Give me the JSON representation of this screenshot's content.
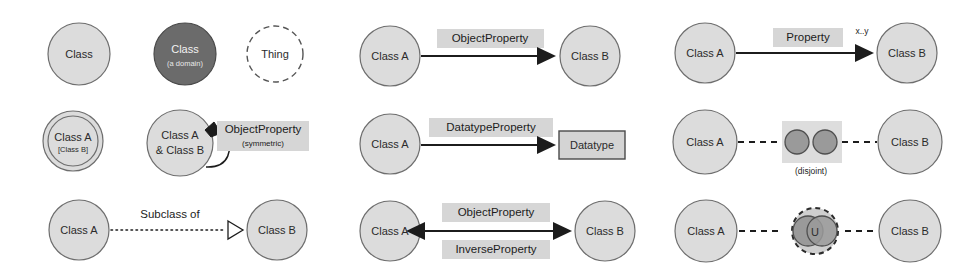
{
  "diagram": {
    "colors": {
      "class_fill": "#dcdcdc",
      "class_stroke": "#6e6e6e",
      "domain_fill": "#6b6b6b",
      "domain_stroke": "#4a4a4a",
      "thing_stroke": "#555555",
      "label_box_fill": "#d6d6d6",
      "datatype_fill": "#d4d4d4",
      "datatype_stroke": "#4a4a4a",
      "line": "#1c1c1c",
      "small_circle_fill": "#9a9a9a",
      "small_circle_stroke": "#4f4f4f",
      "text": "#1c1c1c",
      "text_on_dark": "#f2f2f2"
    },
    "columns": [
      {
        "name": "column-left",
        "rows": [
          {
            "name": "row-class-variants",
            "nodes": [
              {
                "name": "class-node",
                "label": "Class",
                "sub_label": "",
                "style": "filled-circle"
              },
              {
                "name": "class-domain-node",
                "label": "Class",
                "sub_label": "(a domain)",
                "style": "dark-circle"
              },
              {
                "name": "thing-node",
                "label": "Thing",
                "sub_label": "",
                "style": "dashed-circle"
              }
            ]
          },
          {
            "name": "row-equivalent-and-symmetric",
            "nodes": [
              {
                "name": "equivalent-class-node",
                "label": "Class A",
                "sub_label": "[Class B]",
                "style": "double-circle"
              },
              {
                "name": "merged-class-node",
                "label_line1": "Class A",
                "label_line2": "& Class B",
                "style": "filled-circle"
              }
            ],
            "edge": {
              "name": "symmetric-object-property-edge",
              "label": "ObjectProperty",
              "sub_label": "(symmetric)",
              "style": "self-loop-solid-arrow"
            }
          },
          {
            "name": "row-subclass",
            "source": {
              "name": "source-class-node",
              "label": "Class A"
            },
            "target": {
              "name": "target-class-node",
              "label": "Class B"
            },
            "edge": {
              "name": "subclass-of-edge",
              "label": "Subclass of",
              "style": "dotted-line-hollow-triangle"
            }
          }
        ]
      },
      {
        "name": "column-middle",
        "rows": [
          {
            "name": "row-object-property",
            "source": {
              "name": "source-class-node",
              "label": "Class A"
            },
            "target": {
              "name": "target-class-node",
              "label": "Class B"
            },
            "edge": {
              "name": "object-property-edge",
              "label": "ObjectProperty",
              "style": "solid-line-filled-arrow"
            }
          },
          {
            "name": "row-datatype-property",
            "source": {
              "name": "source-class-node",
              "label": "Class A"
            },
            "target": {
              "name": "datatype-node",
              "label": "Datatype",
              "style": "rectangle"
            },
            "edge": {
              "name": "datatype-property-edge",
              "label": "DatatypeProperty",
              "style": "solid-line-filled-arrow"
            }
          },
          {
            "name": "row-inverse-property",
            "source": {
              "name": "source-class-node",
              "label": "Class A"
            },
            "target": {
              "name": "target-class-node",
              "label": "Class B"
            },
            "edge": {
              "name": "inverse-property-edge",
              "label_above": "ObjectProperty",
              "label_below": "InverseProperty",
              "style": "double-headed-solid-arrow"
            }
          }
        ]
      },
      {
        "name": "column-right",
        "rows": [
          {
            "name": "row-cardinality-property",
            "source": {
              "name": "source-class-node",
              "label": "Class A"
            },
            "target": {
              "name": "target-class-node",
              "label": "Class B"
            },
            "edge": {
              "name": "property-cardinality-edge",
              "label": "Property",
              "cardinality": "x..y",
              "style": "solid-line-filled-arrow"
            }
          },
          {
            "name": "row-disjoint",
            "source": {
              "name": "source-class-node",
              "label": "Class A"
            },
            "target": {
              "name": "target-class-node",
              "label": "Class B"
            },
            "edge": {
              "name": "disjoint-edge",
              "caption": "(disjoint)",
              "style": "dashed-line-with-two-separate-circles"
            }
          },
          {
            "name": "row-union",
            "source": {
              "name": "source-class-node",
              "label": "Class A"
            },
            "target": {
              "name": "target-class-node",
              "label": "Class B"
            },
            "edge": {
              "name": "union-edge",
              "glyph": "U",
              "style": "dashed-line-with-union-symbol"
            }
          }
        ]
      }
    ]
  }
}
